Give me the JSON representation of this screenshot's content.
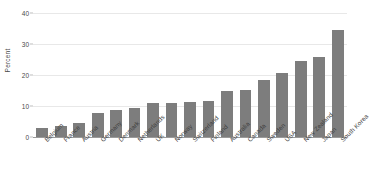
{
  "chart_data": {
    "type": "bar",
    "title": "",
    "subtitle": "",
    "xlabel": "",
    "ylabel": "Percent",
    "ylim": [
      0,
      40
    ],
    "yticks": [
      0,
      10,
      20,
      30,
      40
    ],
    "ytick_labels": [
      "0",
      "10",
      "20",
      "30",
      "40"
    ],
    "grid": true,
    "legend": false,
    "legend_position": "none",
    "bar_color": "#7d7d7d",
    "gridline_color": "#e8e8e8",
    "axis_color": "#9a9a9a",
    "categories": [
      "Belgium",
      "France",
      "Austria",
      "Germany",
      "Denmark",
      "Netherlands",
      "UK",
      "Norway",
      "Switzerland",
      "Finland",
      "Australia",
      "Canada",
      "Sweden",
      "USA",
      "New Zealand",
      "Japan",
      "South Korea"
    ],
    "values": [
      2.8,
      3.4,
      4.5,
      7.8,
      8.6,
      9.4,
      11.0,
      11.1,
      11.4,
      11.7,
      14.9,
      15.2,
      18.3,
      20.5,
      24.6,
      25.8,
      34.4
    ]
  }
}
